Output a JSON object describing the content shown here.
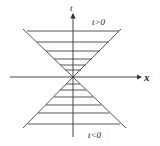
{
  "diagram": {
    "axes": {
      "x_label": "x",
      "t_label": "t"
    },
    "regions": {
      "future_label": "t>0",
      "past_label": "t<0"
    },
    "colors": {
      "line": "#333333",
      "background": "#ffffff"
    }
  }
}
